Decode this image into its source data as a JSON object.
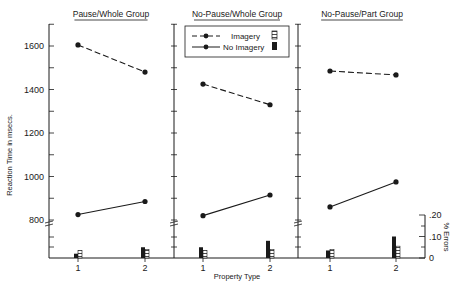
{
  "chart_data": {
    "type": "line",
    "title": "",
    "ylabel": "Reaction Time in msecs.",
    "xlabel": "Property Type",
    "y2label": "% Errors",
    "ylim": [
      800,
      1700
    ],
    "y_ticks": [
      800,
      1000,
      1200,
      1400,
      1600
    ],
    "y2lim": [
      0,
      0.2
    ],
    "y2_ticks": [
      "0",
      ".10",
      ".20"
    ],
    "x_ticks": [
      "1",
      "2"
    ],
    "grid": false,
    "legend": {
      "position": "top-center",
      "entries": [
        {
          "label": "Imagery",
          "line": "dashed",
          "bar": "hatched"
        },
        {
          "label": "No Imagery",
          "line": "solid",
          "bar": "solid-black"
        }
      ]
    },
    "panels": [
      {
        "title": "Pause/Whole Group",
        "series": [
          {
            "name": "Imagery",
            "values": [
              1605,
              1480
            ]
          },
          {
            "name": "No Imagery",
            "values": [
              825,
              885
            ]
          }
        ],
        "errors": [
          {
            "name": "No Imagery",
            "values": [
              0.02,
              0.05
            ]
          },
          {
            "name": "Imagery",
            "values": [
              0.035,
              0.04
            ]
          }
        ]
      },
      {
        "title": "No-Pause/Whole Group",
        "series": [
          {
            "name": "Imagery",
            "values": [
              1425,
              1330
            ]
          },
          {
            "name": "No Imagery",
            "values": [
              820,
              915
            ]
          }
        ],
        "errors": [
          {
            "name": "No Imagery",
            "values": [
              0.05,
              0.08
            ]
          },
          {
            "name": "Imagery",
            "values": [
              0.035,
              0.04
            ]
          }
        ]
      },
      {
        "title": "No-Pause/Part Group",
        "series": [
          {
            "name": "Imagery",
            "values": [
              1485,
              1467
            ]
          },
          {
            "name": "No Imagery",
            "values": [
              860,
              975
            ]
          }
        ],
        "errors": [
          {
            "name": "No Imagery",
            "values": [
              0.035,
              0.1
            ]
          },
          {
            "name": "Imagery",
            "values": [
              0.04,
              0.055
            ]
          }
        ]
      }
    ]
  },
  "colors": {
    "ink": "#1a1a1a",
    "background": "#ffffff"
  }
}
